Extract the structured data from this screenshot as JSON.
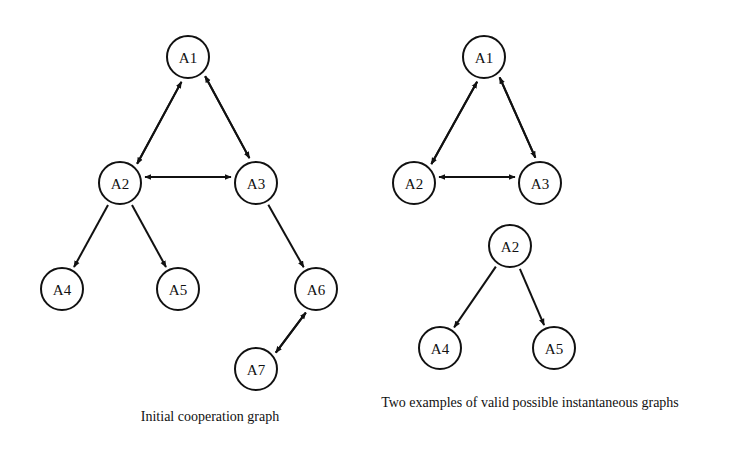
{
  "diagrams": [
    {
      "id": "initial",
      "caption": "Initial cooperation graph",
      "nodes": [
        {
          "id": "A1",
          "label": "A1",
          "x": 188,
          "y": 57
        },
        {
          "id": "A2",
          "label": "A2",
          "x": 120,
          "y": 183
        },
        {
          "id": "A3",
          "label": "A3",
          "x": 256,
          "y": 183
        },
        {
          "id": "A4",
          "label": "A4",
          "x": 62,
          "y": 289
        },
        {
          "id": "A5",
          "label": "A5",
          "x": 178,
          "y": 289
        },
        {
          "id": "A6",
          "label": "A6",
          "x": 316,
          "y": 289
        },
        {
          "id": "A7",
          "label": "A7",
          "x": 256,
          "y": 369
        }
      ],
      "edges": [
        {
          "from": "A1",
          "to": "A2",
          "bidirectional": true
        },
        {
          "from": "A1",
          "to": "A3",
          "bidirectional": true
        },
        {
          "from": "A2",
          "to": "A3",
          "bidirectional": true
        },
        {
          "from": "A2",
          "to": "A4",
          "bidirectional": false
        },
        {
          "from": "A2",
          "to": "A5",
          "bidirectional": false
        },
        {
          "from": "A3",
          "to": "A6",
          "bidirectional": false
        },
        {
          "from": "A6",
          "to": "A7",
          "bidirectional": true
        }
      ]
    },
    {
      "id": "instantaneous",
      "caption": "Two examples of valid possible instantaneous graphs",
      "subgraphs": [
        {
          "nodes": [
            {
              "id": "A1",
              "label": "A1",
              "x": 484,
              "y": 57
            },
            {
              "id": "A2",
              "label": "A2",
              "x": 414,
              "y": 183
            },
            {
              "id": "A3",
              "label": "A3",
              "x": 540,
              "y": 183
            }
          ],
          "edges": [
            {
              "from": "A1",
              "to": "A2",
              "bidirectional": true
            },
            {
              "from": "A1",
              "to": "A3",
              "bidirectional": true
            },
            {
              "from": "A2",
              "to": "A3",
              "bidirectional": true
            }
          ]
        },
        {
          "nodes": [
            {
              "id": "A2",
              "label": "A2",
              "x": 510,
              "y": 246
            },
            {
              "id": "A4",
              "label": "A4",
              "x": 440,
              "y": 348
            },
            {
              "id": "A5",
              "label": "A5",
              "x": 554,
              "y": 348
            }
          ],
          "edges": [
            {
              "from": "A2",
              "to": "A4",
              "bidirectional": false
            },
            {
              "from": "A2",
              "to": "A5",
              "bidirectional": false
            }
          ]
        }
      ]
    }
  ],
  "style": {
    "stroke": "#111111",
    "background": "#ffffff",
    "node_radius": 21
  }
}
